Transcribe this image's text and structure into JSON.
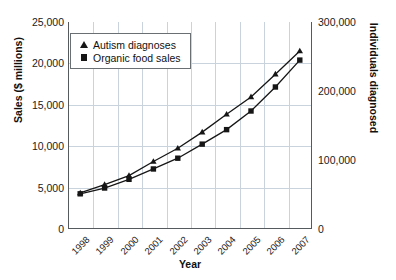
{
  "chart_data": {
    "type": "line",
    "title": "",
    "xlabel": "Year",
    "ylabel": "Sales ($ millions)",
    "y2label": "Individuals diagnosed",
    "grid": true,
    "legend_position": "upper-left-inside",
    "categories": [
      "1998",
      "1999",
      "2000",
      "2001",
      "2002",
      "2003",
      "2004",
      "2005",
      "2006",
      "2007"
    ],
    "ylim": [
      0,
      25000
    ],
    "yticks": [
      "0",
      "5,000",
      "10,000",
      "15,000",
      "20,000",
      "25,000"
    ],
    "ytick_values": [
      0,
      5000,
      10000,
      15000,
      20000,
      25000
    ],
    "y2lim": [
      0,
      300000
    ],
    "y2ticks": [
      "0",
      "100,000",
      "200,000",
      "300,000"
    ],
    "y2tick_values": [
      0,
      100000,
      200000,
      300000
    ],
    "series": [
      {
        "name": "Autism diagnoses",
        "marker": "triangle",
        "axis": "right",
        "values": [
          52000,
          64000,
          77000,
          98000,
          117000,
          140000,
          166000,
          191000,
          224000,
          258000
        ],
        "plot_values": [
          4350,
          5350,
          6450,
          8150,
          9750,
          11700,
          13850,
          15950,
          18700,
          21500
        ]
      },
      {
        "name": "Organic food sales",
        "marker": "square",
        "axis": "left",
        "values": [
          4250,
          4950,
          6000,
          7250,
          8550,
          10250,
          12000,
          14250,
          17150,
          20400
        ]
      }
    ]
  },
  "legend": {
    "items": [
      {
        "label": "Autism diagnoses",
        "marker": "triangle"
      },
      {
        "label": "Organic food sales",
        "marker": "square"
      }
    ]
  },
  "axes": {
    "x_title": "Year",
    "y_left_title": "Sales ($ millions)",
    "y_right_title": "Individuals diagnosed",
    "x_ticks": [
      "1998",
      "1999",
      "2000",
      "2001",
      "2002",
      "2003",
      "2004",
      "2005",
      "2006",
      "2007"
    ],
    "y_left_ticks": [
      "25,000",
      "20,000",
      "15,000",
      "10,000",
      "5,000",
      "0"
    ],
    "y_right_ticks": [
      "300,000",
      "200,000",
      "100,000",
      "0"
    ]
  },
  "colors": {
    "marker": "#161616",
    "line": "#161616",
    "grid": "#c9d3dd",
    "frame": "#555a5e",
    "background": "#ffffff"
  }
}
